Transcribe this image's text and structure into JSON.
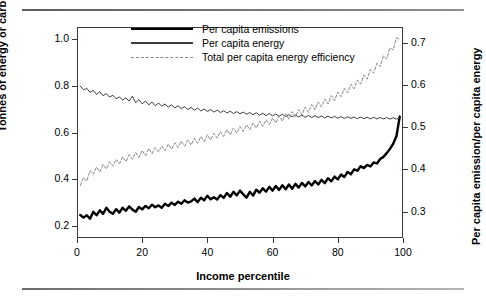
{
  "chart_data": {
    "type": "line",
    "title": "",
    "xlabel": "Income percentile",
    "ylabel": "Tonnes of energy or carbon",
    "ylabel_right": "Per capita emission/per capita energy",
    "xlim": [
      0,
      100
    ],
    "ylim": [
      0.15,
      1.05
    ],
    "ylim_right": [
      0.2375,
      0.7375
    ],
    "xticks": [
      0,
      20,
      40,
      60,
      80,
      100
    ],
    "xtick_labels": [
      "0",
      "20",
      "40",
      "60",
      "80",
      "100"
    ],
    "yticks": [
      0.2,
      0.4,
      0.6,
      0.8,
      1.0
    ],
    "ytick_labels": [
      "0.2",
      "0.4",
      "0.6",
      "0.8",
      "1.0"
    ],
    "yticks_right": [
      0.3,
      0.4,
      0.5,
      0.6,
      0.7
    ],
    "ytick_labels_right": [
      "0.3",
      "0.4",
      "0.5",
      "0.6",
      "0.7"
    ],
    "grid": false,
    "legend_position": "top-center",
    "x": [
      1,
      2,
      3,
      4,
      5,
      6,
      7,
      8,
      9,
      10,
      11,
      12,
      13,
      14,
      15,
      16,
      17,
      18,
      19,
      20,
      21,
      22,
      23,
      24,
      25,
      26,
      27,
      28,
      29,
      30,
      31,
      32,
      33,
      34,
      35,
      36,
      37,
      38,
      39,
      40,
      41,
      42,
      43,
      44,
      45,
      46,
      47,
      48,
      49,
      50,
      51,
      52,
      53,
      54,
      55,
      56,
      57,
      58,
      59,
      60,
      61,
      62,
      63,
      64,
      65,
      66,
      67,
      68,
      69,
      70,
      71,
      72,
      73,
      74,
      75,
      76,
      77,
      78,
      79,
      80,
      81,
      82,
      83,
      84,
      85,
      86,
      87,
      88,
      89,
      90,
      91,
      92,
      93,
      94,
      95,
      96,
      97,
      98,
      99
    ],
    "series": [
      {
        "name": "Per capita emissions",
        "axis": "left",
        "style": "solid-thick",
        "color": "#000000",
        "values": [
          0.248,
          0.237,
          0.247,
          0.232,
          0.262,
          0.247,
          0.268,
          0.253,
          0.279,
          0.262,
          0.253,
          0.273,
          0.258,
          0.279,
          0.266,
          0.285,
          0.271,
          0.262,
          0.282,
          0.272,
          0.287,
          0.277,
          0.292,
          0.281,
          0.289,
          0.279,
          0.296,
          0.286,
          0.301,
          0.291,
          0.305,
          0.296,
          0.311,
          0.301,
          0.306,
          0.318,
          0.303,
          0.322,
          0.311,
          0.33,
          0.315,
          0.324,
          0.314,
          0.333,
          0.321,
          0.342,
          0.326,
          0.347,
          0.332,
          0.352,
          0.336,
          0.322,
          0.347,
          0.331,
          0.356,
          0.343,
          0.362,
          0.348,
          0.368,
          0.352,
          0.372,
          0.355,
          0.375,
          0.358,
          0.378,
          0.36,
          0.381,
          0.365,
          0.385,
          0.37,
          0.389,
          0.374,
          0.393,
          0.378,
          0.398,
          0.384,
          0.405,
          0.392,
          0.412,
          0.4,
          0.421,
          0.41,
          0.432,
          0.422,
          0.443,
          0.437,
          0.456,
          0.448,
          0.462,
          0.455,
          0.472,
          0.468,
          0.487,
          0.496,
          0.512,
          0.53,
          0.552,
          0.585,
          0.668
        ]
      },
      {
        "name": "Per capita energy",
        "axis": "left",
        "style": "solid-thin",
        "color": "#3d3d3d",
        "values": [
          0.798,
          0.782,
          0.788,
          0.771,
          0.78,
          0.762,
          0.774,
          0.757,
          0.766,
          0.751,
          0.759,
          0.744,
          0.752,
          0.738,
          0.748,
          0.734,
          0.755,
          0.727,
          0.74,
          0.722,
          0.734,
          0.718,
          0.73,
          0.714,
          0.726,
          0.712,
          0.722,
          0.708,
          0.718,
          0.705,
          0.714,
          0.702,
          0.71,
          0.698,
          0.707,
          0.695,
          0.704,
          0.692,
          0.7,
          0.69,
          0.698,
          0.687,
          0.696,
          0.685,
          0.693,
          0.683,
          0.691,
          0.681,
          0.689,
          0.68,
          0.687,
          0.678,
          0.685,
          0.676,
          0.684,
          0.674,
          0.682,
          0.672,
          0.681,
          0.671,
          0.679,
          0.669,
          0.678,
          0.668,
          0.676,
          0.667,
          0.675,
          0.666,
          0.674,
          0.665,
          0.673,
          0.664,
          0.672,
          0.663,
          0.671,
          0.662,
          0.67,
          0.662,
          0.669,
          0.661,
          0.668,
          0.66,
          0.667,
          0.66,
          0.666,
          0.659,
          0.666,
          0.659,
          0.665,
          0.658,
          0.665,
          0.658,
          0.664,
          0.658,
          0.664,
          0.657,
          0.663,
          0.657,
          0.663
        ]
      },
      {
        "name": "Total per capita energy efficiency",
        "axis": "right",
        "style": "dashed",
        "color": "#8a8a8a",
        "values": [
          0.362,
          0.381,
          0.372,
          0.398,
          0.388,
          0.406,
          0.394,
          0.412,
          0.401,
          0.418,
          0.408,
          0.424,
          0.413,
          0.43,
          0.418,
          0.435,
          0.424,
          0.44,
          0.428,
          0.445,
          0.432,
          0.45,
          0.437,
          0.452,
          0.441,
          0.456,
          0.444,
          0.46,
          0.448,
          0.463,
          0.452,
          0.467,
          0.455,
          0.47,
          0.458,
          0.474,
          0.462,
          0.478,
          0.466,
          0.482,
          0.47,
          0.486,
          0.474,
          0.49,
          0.478,
          0.494,
          0.482,
          0.498,
          0.486,
          0.502,
          0.49,
          0.506,
          0.494,
          0.51,
          0.498,
          0.514,
          0.502,
          0.518,
          0.506,
          0.522,
          0.51,
          0.527,
          0.514,
          0.532,
          0.519,
          0.537,
          0.524,
          0.542,
          0.529,
          0.548,
          0.535,
          0.554,
          0.541,
          0.56,
          0.548,
          0.567,
          0.555,
          0.575,
          0.563,
          0.583,
          0.572,
          0.592,
          0.581,
          0.602,
          0.591,
          0.612,
          0.602,
          0.624,
          0.614,
          0.637,
          0.628,
          0.652,
          0.644,
          0.669,
          0.662,
          0.688,
          0.683,
          0.712,
          0.708
        ]
      }
    ]
  },
  "legend": {
    "items": [
      {
        "label": "Per capita emissions"
      },
      {
        "label": "Per capita energy"
      },
      {
        "label": "Total per capita energy efficiency"
      }
    ]
  }
}
